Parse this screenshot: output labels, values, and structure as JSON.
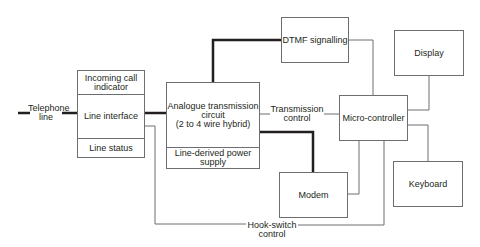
{
  "diagram": {
    "type": "block-diagram",
    "title": "",
    "external": {
      "telephone_line": "Telephone\nline"
    },
    "blocks": {
      "line_interface": {
        "sections": [
          "Incoming call\nindicator",
          "Line interface",
          "Line status"
        ]
      },
      "analogue": {
        "sections": [
          "Analogue transmission\ncircuit\n(2 to 4 wire hybrid)",
          "Line-derived power\nsupply"
        ]
      },
      "dtmf": {
        "label": "DTMF signalling"
      },
      "micro": {
        "label": "Micro-controller"
      },
      "display": {
        "label": "Display"
      },
      "keyboard": {
        "label": "Keyboard"
      },
      "modem": {
        "label": "Modem"
      }
    },
    "connection_labels": {
      "transmission_control": "Transmission\ncontrol",
      "hook_switch_control": "Hook-switch\ncontrol"
    },
    "connections": [
      {
        "from": "Telephone line",
        "to": "Line interface",
        "style": "thick"
      },
      {
        "from": "Line interface",
        "to": "Analogue transmission circuit",
        "style": "thick"
      },
      {
        "from": "Analogue transmission circuit",
        "to": "DTMF signalling",
        "style": "thick"
      },
      {
        "from": "Analogue transmission circuit",
        "to": "Modem",
        "style": "thick"
      },
      {
        "from": "Micro-controller",
        "to": "Analogue transmission circuit",
        "style": "thin",
        "label": "Transmission control"
      },
      {
        "from": "DTMF signalling",
        "to": "Micro-controller",
        "style": "thin"
      },
      {
        "from": "Display",
        "to": "Micro-controller",
        "style": "thin"
      },
      {
        "from": "Micro-controller",
        "to": "Keyboard",
        "style": "thin"
      },
      {
        "from": "Modem",
        "to": "Micro-controller",
        "style": "thin"
      },
      {
        "from": "Micro-controller",
        "to": "Line interface",
        "style": "thin",
        "label": "Hook-switch control"
      }
    ],
    "colors": {
      "thick_line": "#231f20",
      "thin_line": "#6d6e71",
      "text": "#231f20"
    }
  }
}
